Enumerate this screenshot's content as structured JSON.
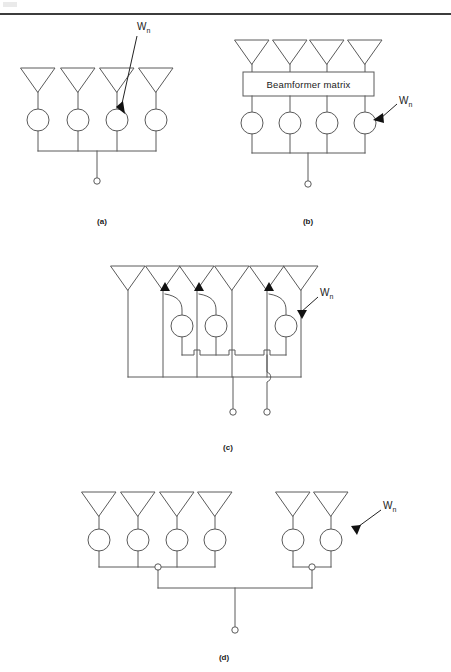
{
  "page": {
    "width": 451,
    "height": 672,
    "background": "#ffffff",
    "header_rule_color": "#3c3c3c",
    "line_color": "#5a5a5a",
    "text_color": "#1a1a1a"
  },
  "labels": {
    "weight_symbol": "W",
    "weight_subscript": "n",
    "beamformer_box": "Beamformer  matrix"
  },
  "captions": {
    "a": "(a)",
    "b": "(b)",
    "c": "(c)",
    "d": "(d)"
  },
  "figures": [
    {
      "id": "a",
      "caption": "(a)",
      "element_count": 4,
      "antenna_x": [
        38,
        78,
        117,
        156
      ],
      "antenna_top_y": 68,
      "antenna_bottom_y": 92,
      "circle_cy": 120,
      "circle_r": 11,
      "bus_y": 151,
      "output_x": 97,
      "output_dot_y": 181,
      "has_beamformer_matrix": false,
      "weight_label_xy": [
        140,
        27
      ],
      "outputs": 1
    },
    {
      "id": "b",
      "caption": "(b)",
      "element_count": 4,
      "antenna_x": [
        252,
        290,
        327,
        365
      ],
      "antenna_top_y": 40,
      "antenna_bottom_y": 64,
      "box": {
        "x": 243,
        "y": 72,
        "width": 131,
        "height": 24,
        "text": "Beamformer  matrix"
      },
      "circle_cy": 123,
      "circle_r": 11,
      "bus_y": 153,
      "output_x": 308,
      "output_dot_y": 184,
      "has_beamformer_matrix": true,
      "weight_label_xy": [
        402,
        100
      ],
      "outputs": 1
    },
    {
      "id": "c",
      "caption": "(c)",
      "element_count": 6,
      "antenna_x": [
        128,
        163,
        197,
        232,
        267,
        301
      ],
      "antenna_top_y": 266,
      "antenna_bottom_y": 290,
      "weighted_elements": [
        1,
        2,
        4
      ],
      "circle_cy": 326,
      "circle_r": 11,
      "mid_bus_y": 355,
      "bus_y": 377,
      "outputs": 2,
      "output_x": [
        233,
        267
      ],
      "output_dot_y": 412,
      "weight_label_xy": [
        323,
        293
      ],
      "has_beamformer_matrix": false
    },
    {
      "id": "d",
      "caption": "(d)",
      "element_count": 6,
      "subarrays": [
        {
          "antenna_x": [
            99,
            138,
            177,
            215
          ],
          "junction_x": 158
        },
        {
          "antenna_x": [
            293,
            331
          ],
          "junction_x": 312
        }
      ],
      "antenna_top_y": 492,
      "antenna_bottom_y": 516,
      "circle_cy": 540,
      "circle_r": 11,
      "sub_bus_y": 567,
      "junction_r": 3,
      "main_bus_y": 588,
      "output_x": 235,
      "output_dot_y": 630,
      "weight_label_xy": [
        385,
        507
      ],
      "outputs": 1,
      "has_beamformer_matrix": false
    }
  ]
}
